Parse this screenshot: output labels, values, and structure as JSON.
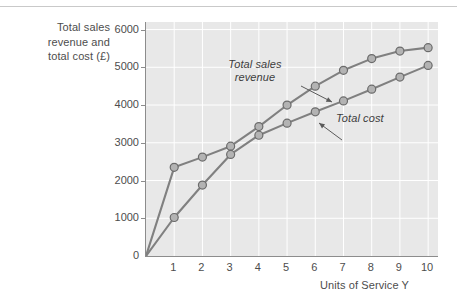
{
  "chart_data": {
    "type": "line",
    "title": "",
    "xlabel": "Units of Service Y",
    "ylabel": "Total sales revenue and total cost (£)",
    "ylabel_lines": [
      "Total sales",
      "revenue and",
      "total cost (£)"
    ],
    "x": [
      0,
      1,
      2,
      3,
      4,
      5,
      6,
      7,
      8,
      9,
      10
    ],
    "xlim": [
      0,
      10.35
    ],
    "ylim": [
      0,
      6200
    ],
    "xticks": [
      1,
      2,
      3,
      4,
      5,
      6,
      7,
      8,
      9,
      10
    ],
    "xtick_labels": [
      "1",
      "2",
      "3",
      "4",
      "5",
      "6",
      "7",
      "8",
      "9",
      "10"
    ],
    "yticks": [
      0,
      1000,
      2000,
      3000,
      4000,
      5000,
      6000
    ],
    "ytick_labels": [
      "0",
      "1000",
      "2000",
      "3000",
      "4000",
      "5000",
      "6000"
    ],
    "grid": true,
    "legend": "none",
    "marker": "circle",
    "series": [
      {
        "name": "Total sales revenue",
        "color": "#808080",
        "values": [
          0,
          2350,
          2620,
          2910,
          3430,
          4000,
          4500,
          4920,
          5230,
          5430,
          5520
        ]
      },
      {
        "name": "Total cost",
        "color": "#808080",
        "values": [
          0,
          1020,
          1880,
          2690,
          3200,
          3520,
          3820,
          4110,
          4420,
          4740,
          5050
        ]
      }
    ],
    "annotations": [
      {
        "id": "revenue-label",
        "text": "Total sales revenue",
        "lines": [
          "Total sales",
          "revenue"
        ],
        "style": "italic",
        "points_to": {
          "x": 6.0,
          "y": 4500
        }
      },
      {
        "id": "cost-label",
        "text": "Total cost",
        "lines": [
          "Total cost"
        ],
        "style": "italic",
        "points_to": {
          "x": 6.0,
          "y": 3820
        }
      }
    ],
    "colors": {
      "plot_background": "#e8e8e8",
      "gridline": "#ffffff",
      "axis": "#8c8c8c",
      "line": "#808080",
      "marker_fill": "#b3b3b3",
      "marker_edge": "#6b6b6b",
      "text": "#4d4d4d",
      "page_background": "#ffffff"
    }
  }
}
